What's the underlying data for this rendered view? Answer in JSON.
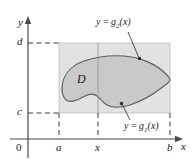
{
  "figure": {
    "type": "calculus-double-integral-type-I-region",
    "axes": {
      "x_axis_name": "x",
      "y_axis_name": "y",
      "origin_label": "0"
    },
    "tick_labels": {
      "x": [
        "a",
        "x",
        "b"
      ],
      "y": [
        "c",
        "d"
      ]
    },
    "region_label": "D",
    "curve_labels": {
      "upper": {
        "lhs": "y",
        "eq": " = ",
        "fn": "g",
        "sub": "2",
        "arg": "(x)",
        "full": "y = g2(x)"
      },
      "lower": {
        "lhs": "y",
        "eq": " = ",
        "fn": "g",
        "sub": "1",
        "arg": "(x)",
        "full": "y = g1(x)"
      }
    },
    "colors": {
      "rectangle_fill": "#e2e2e2",
      "region_fill": "#c9c9c9",
      "region_stroke": "#5b5b5b",
      "axis_stroke": "#4a4a4a",
      "dashed_stroke": "#3a3a3a",
      "leader_stroke": "#3a3a3a",
      "background": "#ffffff",
      "text": "#1a1a1a"
    },
    "geometry": {
      "x_axis_y": 139,
      "y_axis_x": 28,
      "rect_left": 59,
      "rect_right": 170,
      "rect_top": 43,
      "rect_bottom": 113,
      "vline_x": 98
    }
  }
}
